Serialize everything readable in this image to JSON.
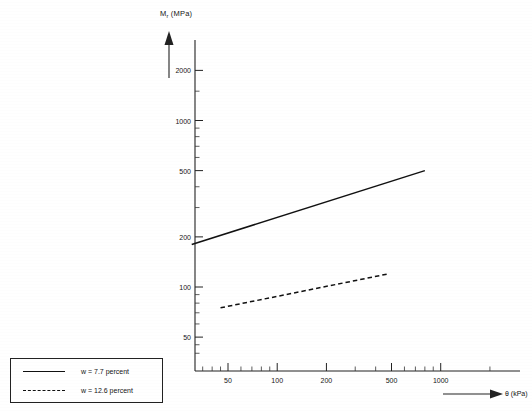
{
  "chart_data": {
    "type": "line",
    "title": "",
    "xlabel": "θ (kPa)",
    "ylabel": "Mᵣ (MPa)",
    "ylabel_main": "M",
    "ylabel_sub": "r",
    "ylabel_units": " (MPa)",
    "xscale": "log",
    "yscale": "log",
    "xlim": [
      30,
      2000
    ],
    "ylim": [
      40,
      2600
    ],
    "grid": false,
    "legend_position": "below-left-outside",
    "xticks": [
      {
        "value": 50,
        "label": "50"
      },
      {
        "value": 100,
        "label": "100"
      },
      {
        "value": 200,
        "label": "200"
      },
      {
        "value": 500,
        "label": "500"
      },
      {
        "value": 1000,
        "label": "1000"
      }
    ],
    "yticks": [
      {
        "value": 50,
        "label": "50"
      },
      {
        "value": 100,
        "label": "100"
      },
      {
        "value": 200,
        "label": "200"
      },
      {
        "value": 500,
        "label": "500"
      },
      {
        "value": 1000,
        "label": "1000"
      },
      {
        "value": 2000,
        "label": "2000"
      }
    ],
    "xminor": [
      60,
      70,
      80,
      90,
      300,
      400,
      600,
      700,
      800,
      900,
      2000
    ],
    "yminor": [
      60,
      70,
      80,
      90,
      300,
      400,
      600,
      700,
      800,
      900,
      1500
    ],
    "series": [
      {
        "name": "w = 7.7 percent",
        "style": "solid",
        "color": "#111111",
        "x": [
          30,
          800
        ],
        "y": [
          180,
          500
        ]
      },
      {
        "name": "w = 12.6 percent",
        "style": "dashed",
        "color": "#111111",
        "x": [
          45,
          480
        ],
        "y": [
          75,
          120
        ]
      }
    ]
  },
  "legend": {
    "items": [
      {
        "label": "w = 7.7 percent",
        "style": "solid"
      },
      {
        "label": "w = 12.6 percent",
        "style": "dashed"
      }
    ]
  }
}
